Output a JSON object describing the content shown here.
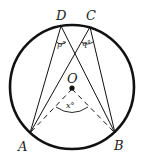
{
  "diagram": {
    "points": {
      "A": "A",
      "B": "B",
      "C": "C",
      "D": "D",
      "O": "O"
    },
    "angle_labels": {
      "p": "p°",
      "q": "q°",
      "x": "x°"
    },
    "colors": {
      "stroke": "#111111",
      "background": "#ffffff"
    }
  }
}
